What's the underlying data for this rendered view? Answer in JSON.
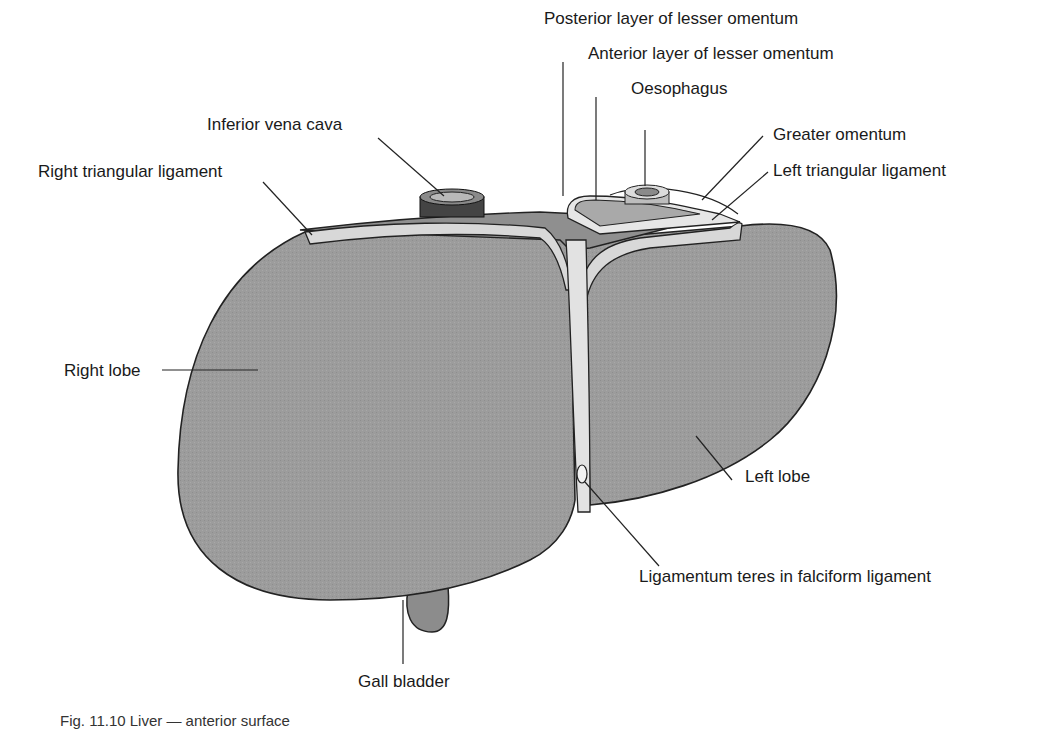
{
  "figure": {
    "caption": "Fig. 11.10 Liver — anterior surface",
    "colors": {
      "lobe_fill": "#9a9a9a",
      "ligament_fill": "#d6d6d6",
      "outline": "#222222",
      "leader": "#222222",
      "gallbladder_fill": "#8a8a8a"
    }
  },
  "labels": {
    "posterior_lesser_omentum": "Posterior layer of lesser omentum",
    "anterior_lesser_omentum": "Anterior layer of lesser omentum",
    "oesophagus": "Oesophagus",
    "inferior_vena_cava": "Inferior vena cava",
    "greater_omentum": "Greater omentum",
    "right_triangular_ligament": "Right triangular ligament",
    "left_triangular_ligament": "Left triangular ligament",
    "right_lobe": "Right lobe",
    "left_lobe": "Left lobe",
    "ligamentum_teres": "Ligamentum teres in falciform ligament",
    "gall_bladder": "Gall bladder"
  }
}
